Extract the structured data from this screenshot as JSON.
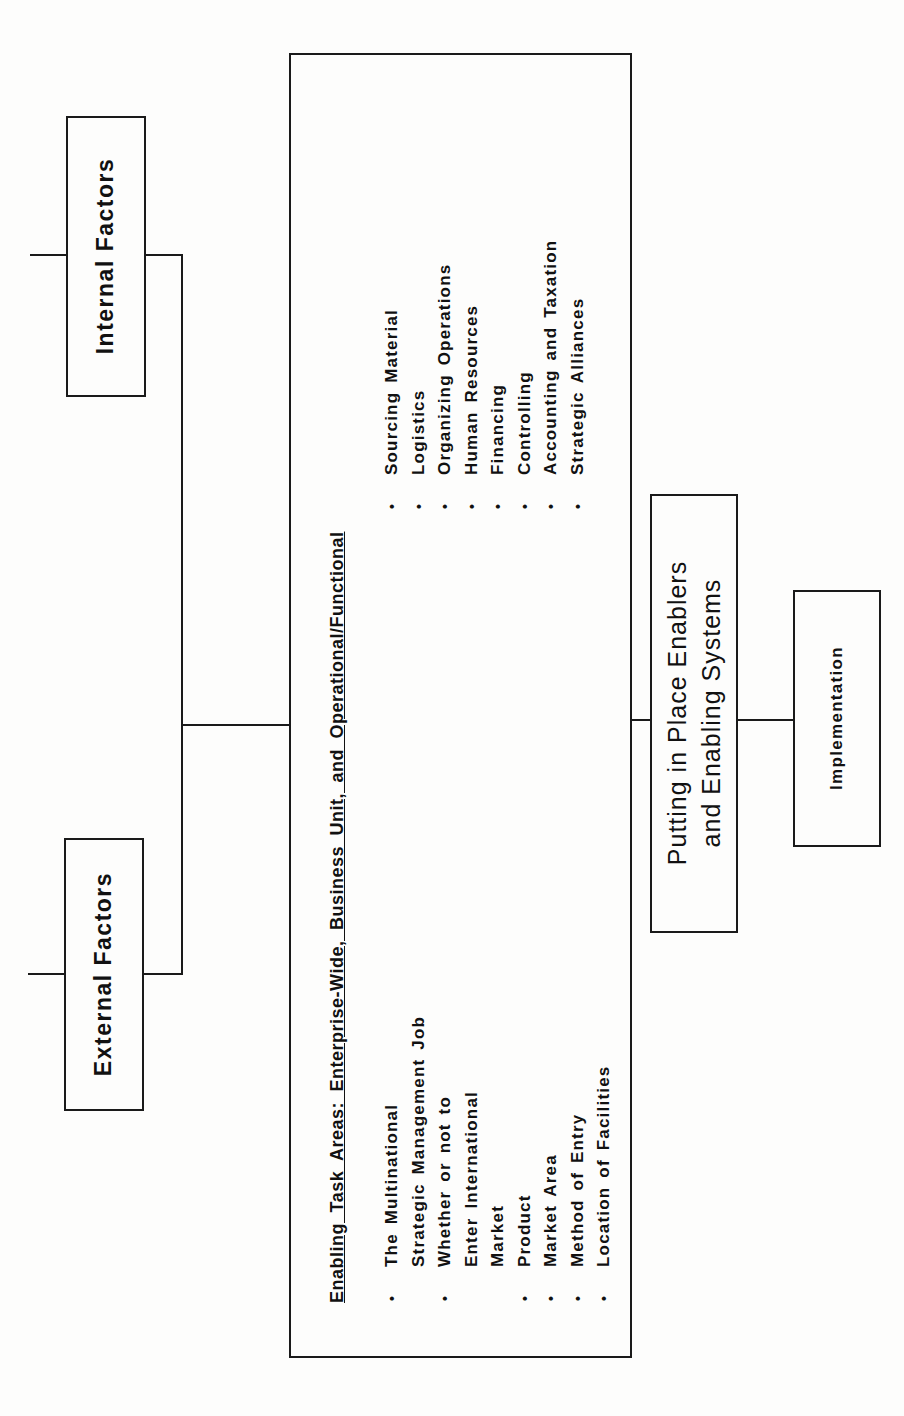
{
  "diagram": {
    "orientation": "rotated -90deg (read bottom-to-top)",
    "internal_factors": {
      "label": "Internal Factors"
    },
    "external_factors": {
      "label": "External Factors"
    },
    "enabling_task_areas": {
      "heading": "Enabling Task Areas:  Enterprise-Wide, Business Unit, and Operational/Functional",
      "left_column": [
        {
          "bullet": "•",
          "text": "The Multinational"
        },
        {
          "bullet": "",
          "text": "Strategic Management Job"
        },
        {
          "bullet": "•",
          "text": "Whether or not to"
        },
        {
          "bullet": "",
          "text": "Enter International"
        },
        {
          "bullet": "",
          "text": "Market"
        },
        {
          "bullet": "•",
          "text": "Product"
        },
        {
          "bullet": "•",
          "text": "Market Area"
        },
        {
          "bullet": "•",
          "text": "Method of Entry"
        },
        {
          "bullet": "•",
          "text": "Location of Facilities"
        }
      ],
      "right_column": [
        {
          "bullet": "•",
          "text": "Sourcing Material"
        },
        {
          "bullet": "•",
          "text": "Logistics"
        },
        {
          "bullet": "•",
          "text": "Organizing Operations"
        },
        {
          "bullet": "•",
          "text": "Human Resources"
        },
        {
          "bullet": "•",
          "text": "Financing"
        },
        {
          "bullet": "•",
          "text": "Controlling"
        },
        {
          "bullet": "•",
          "text": "Accounting and Taxation"
        },
        {
          "bullet": "•",
          "text": "Strategic Alliances"
        }
      ]
    },
    "putting_in_place": {
      "line1": "Putting in Place Enablers",
      "line2": "and Enabling Systems"
    },
    "implementation": {
      "label": "Implementation"
    },
    "colors": {
      "line": "#1a1a1a",
      "background": "#fdfdfc",
      "text": "#111111"
    }
  }
}
